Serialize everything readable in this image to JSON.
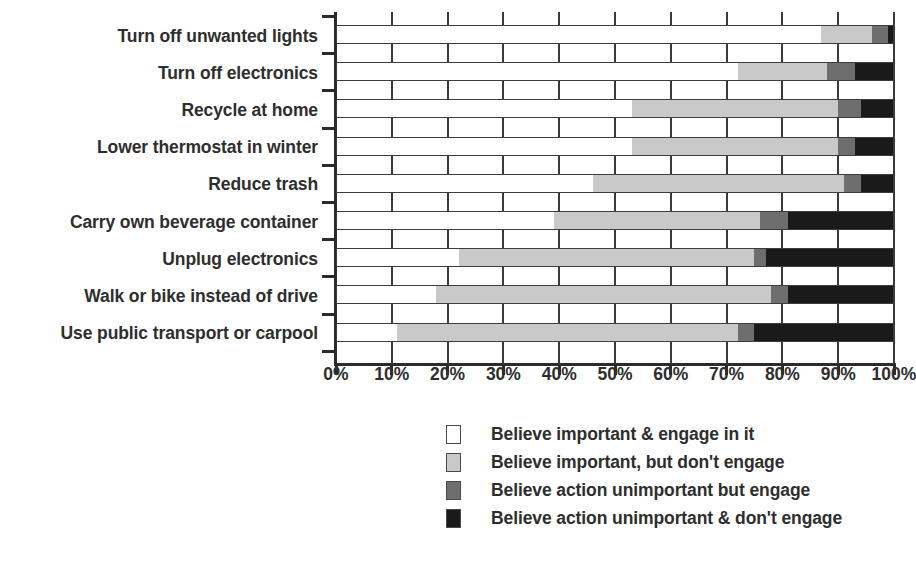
{
  "chart_data": {
    "type": "bar",
    "orientation": "horizontal",
    "stacked": true,
    "normalized_percent": true,
    "title": "",
    "subtitle": "",
    "xlabel": "",
    "ylabel": "",
    "xlim": [
      0,
      100
    ],
    "grid": true,
    "legend_position": "bottom",
    "xticks": [
      0,
      10,
      20,
      30,
      40,
      50,
      60,
      70,
      80,
      90,
      100
    ],
    "xtick_labels": [
      "0%",
      "10%",
      "20%",
      "30%",
      "40%",
      "50%",
      "60%",
      "70%",
      "80%",
      "90%",
      "100%"
    ],
    "categories": [
      "Turn off unwanted lights",
      "Turn off electronics",
      "Recycle at home",
      "Lower thermostat in winter",
      "Reduce trash",
      "Carry own beverage container",
      "Unplug electronics",
      "Walk or bike instead of drive",
      "Use public transport or carpool"
    ],
    "series": [
      {
        "name": "Believe important & engage in it",
        "color": "#ffffff",
        "values": [
          87,
          72,
          53,
          53,
          46,
          39,
          22,
          18,
          11
        ]
      },
      {
        "name": "Believe important, but don't engage",
        "color": "#c9c9c9",
        "values": [
          9,
          16,
          37,
          37,
          45,
          37,
          53,
          60,
          61
        ]
      },
      {
        "name": "Believe action unimportant but engage",
        "color": "#6e6e6e",
        "values": [
          3,
          5,
          4,
          3,
          3,
          5,
          2,
          3,
          3
        ]
      },
      {
        "name": "Believe action unimportant & don't engage",
        "color": "#1a1a1a",
        "values": [
          1,
          7,
          6,
          7,
          6,
          19,
          23,
          19,
          25
        ]
      }
    ]
  },
  "legend": {
    "items": [
      {
        "label": "Believe important & engage in it",
        "color": "#ffffff"
      },
      {
        "label": "Believe important, but don't engage",
        "color": "#c9c9c9"
      },
      {
        "label": "Believe action unimportant but engage",
        "color": "#6e6e6e"
      },
      {
        "label": "Believe action unimportant & don't engage",
        "color": "#1a1a1a"
      }
    ]
  }
}
